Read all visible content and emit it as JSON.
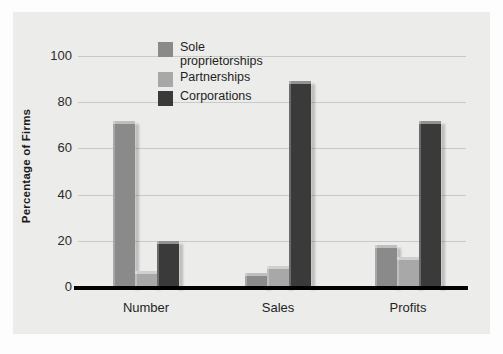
{
  "chart_data": {
    "type": "bar",
    "title": "",
    "subtitle": "",
    "xlabel": "",
    "ylabel": "Percentage of Firms",
    "categories": [
      "Number",
      "Sales",
      "Profits"
    ],
    "series": [
      {
        "name": "Sole proprietorships",
        "color": "#8a8a8a",
        "values": [
          72,
          6,
          18
        ]
      },
      {
        "name": "Partnerships",
        "color": "#a8a8a8",
        "values": [
          7,
          9,
          13
        ]
      },
      {
        "name": "Corporations",
        "color": "#3a3a3a",
        "values": [
          20,
          89,
          72
        ]
      }
    ],
    "ylim": [
      0,
      100
    ],
    "yticks": [
      0,
      20,
      40,
      60,
      80,
      100
    ],
    "ytick_labels": [
      "0",
      "20",
      "40",
      "60",
      "80",
      "100"
    ],
    "grid": true,
    "legend_position": "upper-center-left"
  },
  "axis": {
    "y_title": "Percentage of Firms",
    "ticks": [
      {
        "label": "100",
        "value": 100
      },
      {
        "label": "80",
        "value": 80
      },
      {
        "label": "60",
        "value": 60
      },
      {
        "label": "40",
        "value": 40
      },
      {
        "label": "20",
        "value": 20
      },
      {
        "label": "0",
        "value": 0
      }
    ]
  },
  "categories": [
    {
      "label": "Number"
    },
    {
      "label": "Sales"
    },
    {
      "label": "Profits"
    }
  ],
  "legend": {
    "items": [
      {
        "label": "Sole\nproprietorships",
        "color": "#8a8a8a"
      },
      {
        "label": "Partnerships",
        "color": "#a8a8a8"
      },
      {
        "label": "Corporations",
        "color": "#3a3a3a"
      }
    ]
  },
  "colors": {
    "panel_background": "#ececea",
    "figure_background": "#fdfdfd",
    "gridline": "#c9c9c7",
    "baseline": "#000000",
    "sole_proprietorships": "#8a8a8a",
    "partnerships": "#a8a8a8",
    "corporations": "#3a3a3a"
  }
}
